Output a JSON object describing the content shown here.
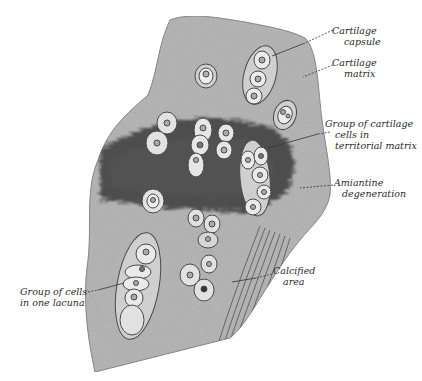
{
  "figure": {
    "colors": {
      "background": "#ffffff",
      "matrix": "#b9b9b9",
      "matrix_light": "#cdcdcd",
      "territorial_dark": "#3a3a3a",
      "capsule_stroke": "#4a4a4a",
      "cell_fill": "#e9e9e9",
      "label_text": "#2a2a2a"
    }
  },
  "labels": [
    {
      "id": "cartilage-capsule",
      "lines": [
        "Cartilage",
        "capsule"
      ]
    },
    {
      "id": "cartilage-matrix",
      "lines": [
        "Cartilage",
        "matrix"
      ]
    },
    {
      "id": "group-territorial",
      "lines": [
        "Group of cartilage",
        "cells in",
        "territorial matrix"
      ]
    },
    {
      "id": "amiantine",
      "lines": [
        "Amiantine",
        "degeneration"
      ]
    },
    {
      "id": "calcified",
      "lines": [
        "Calcified",
        "area"
      ]
    },
    {
      "id": "group-lacuna",
      "lines": [
        "Group of cells",
        "in one lacuna"
      ]
    }
  ]
}
